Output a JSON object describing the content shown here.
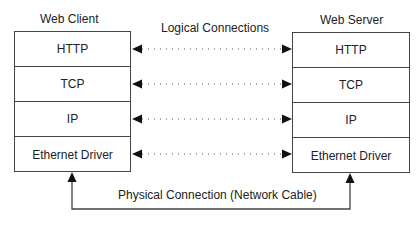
{
  "diagram": {
    "client": {
      "title": "Web Client",
      "layers": [
        "HTTP",
        "TCP",
        "IP",
        "Ethernet Driver"
      ]
    },
    "server": {
      "title": "Web Server",
      "layers": [
        "HTTP",
        "TCP",
        "IP",
        "Ethernet Driver"
      ]
    },
    "logical_label": "Logical Connections",
    "physical_label": "Physical Connection (Network Cable)",
    "colors": {
      "line": "#444444",
      "arrow": "#111111",
      "dots": "#555555"
    }
  }
}
